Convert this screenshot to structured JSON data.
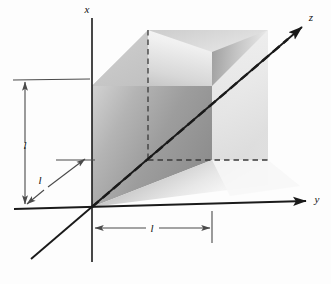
{
  "figure": {
    "kind": "3d-coordinate-cube-diagram",
    "background_color": "#fdfdfd",
    "line_color": "#1a1a1a",
    "dimension_line_color": "#555555",
    "dashed_line_color": "#333333"
  },
  "axes": {
    "x": {
      "label": "x",
      "direction": "up",
      "arrow": false,
      "origin_px": [
        92,
        207
      ],
      "tip_px": [
        92,
        18
      ]
    },
    "y": {
      "label": "y",
      "direction": "right",
      "arrow": true,
      "origin_px": [
        92,
        207
      ],
      "tip_px": [
        312,
        200
      ]
    },
    "z": {
      "label": "z",
      "direction": "up-right-diagonal",
      "arrow": true,
      "origin_px": [
        92,
        207
      ],
      "tip_px": [
        306,
        24
      ],
      "negative_tip_px": [
        31,
        259
      ]
    }
  },
  "solid": {
    "name": "notched-cube",
    "side_length_label": "l",
    "faces": [
      {
        "name": "top-face",
        "shade_from": "#dcdcdc",
        "shade_to": "#f4f4f4"
      },
      {
        "name": "front-left-face",
        "shade_from": "#cfcfcf",
        "shade_to": "#9a9a9a"
      },
      {
        "name": "notch-inner-face",
        "shade_from": "#bdbdbd",
        "shade_to": "#efefef"
      },
      {
        "name": "right-face",
        "shade_from": "#f0f0f0",
        "shade_to": "#d8d8d8"
      }
    ],
    "hidden_edges_style": "dashed"
  },
  "dimensions": [
    {
      "name": "vertical-dimension",
      "label": "l",
      "orientation": "vertical",
      "label_px": [
        22,
        142
      ],
      "arrow_top_px": [
        25,
        82
      ],
      "arrow_bottom_px": [
        25,
        205
      ],
      "extension_line_px": [
        [
          14,
          80
        ],
        [
          88,
          80
        ]
      ]
    },
    {
      "name": "depth-dimension",
      "label": "l",
      "orientation": "diagonal",
      "label_px": [
        48,
        182
      ],
      "arrow_from_px": [
        33,
        204
      ],
      "arrow_to_px": [
        84,
        160
      ],
      "extension_line_px": [
        [
          57,
          160
        ],
        [
          92,
          160
        ]
      ]
    },
    {
      "name": "horizontal-dimension",
      "label": "l",
      "orientation": "horizontal",
      "label_px": [
        152,
        226
      ],
      "arrow_left_px": [
        96,
        228
      ],
      "arrow_right_px": [
        210,
        228
      ],
      "extension_line_left_px": [
        [
          92,
          207
        ],
        [
          92,
          262
        ]
      ],
      "extension_line_right_px": [
        [
          212,
          212
        ],
        [
          212,
          243
        ]
      ]
    }
  ],
  "labels": {
    "x_axis": "x",
    "y_axis": "y",
    "z_axis": "z",
    "vertical_length": "l",
    "depth_length": "l",
    "horizontal_length": "l"
  }
}
